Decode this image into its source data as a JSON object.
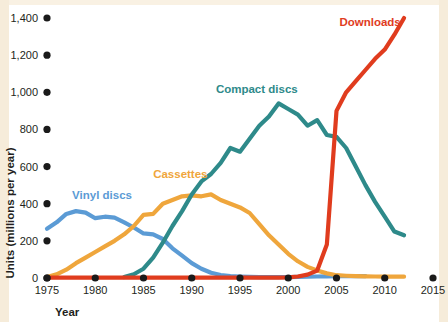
{
  "figure": {
    "background_color": "#ffffff",
    "paper_edge_color": "#f6ecda"
  },
  "chart_data": {
    "type": "line",
    "title": "",
    "xlabel": "Year",
    "ylabel": "Units (millions per year)",
    "xlim": [
      1975,
      2015
    ],
    "ylim": [
      0,
      1400
    ],
    "xticks": [
      1975,
      1980,
      1985,
      1990,
      1995,
      2000,
      2005,
      2010,
      2015
    ],
    "xtick_labels": [
      "1975",
      "1980",
      "1985",
      "1990",
      "1995",
      "2000",
      "2005",
      "2010",
      "2015"
    ],
    "yticks": [
      0,
      200,
      400,
      600,
      800,
      1000,
      1200,
      1400
    ],
    "ytick_labels": [
      "0",
      "200",
      "400",
      "600",
      "800",
      "1,000",
      "1,200",
      "1,400"
    ],
    "grid": false,
    "legend_position": "inline-labels",
    "series": [
      {
        "name": "Vinyl discs",
        "color": "#5B9BD5",
        "label_x": 1977.6,
        "label_y": 425,
        "x": [
          1975,
          1976,
          1977,
          1978,
          1979,
          1980,
          1981,
          1982,
          1983,
          1984,
          1985,
          1986,
          1987,
          1988,
          1989,
          1990,
          1991,
          1992,
          1993,
          1994,
          1995,
          1996,
          1997,
          1998,
          1999,
          2000,
          2001,
          2002,
          2003,
          2004,
          2005,
          2006,
          2007,
          2008
        ],
        "y": [
          265,
          300,
          345,
          360,
          352,
          322,
          330,
          325,
          300,
          272,
          240,
          235,
          210,
          160,
          120,
          80,
          50,
          28,
          16,
          10,
          8,
          6,
          5,
          5,
          5,
          5,
          6,
          7,
          8,
          9,
          10,
          10,
          10,
          10
        ]
      },
      {
        "name": "Cassettes",
        "color": "#EFA63C",
        "label_x": 1986.0,
        "label_y": 540,
        "x": [
          1975,
          1976,
          1977,
          1978,
          1979,
          1980,
          1981,
          1982,
          1983,
          1984,
          1985,
          1986,
          1987,
          1988,
          1989,
          1990,
          1991,
          1992,
          1993,
          1994,
          1995,
          1996,
          1997,
          1998,
          1999,
          2000,
          2001,
          2002,
          2003,
          2004,
          2005,
          2006,
          2007,
          2008,
          2009,
          2010,
          2011,
          2012
        ],
        "y": [
          5,
          20,
          45,
          80,
          110,
          140,
          170,
          200,
          235,
          280,
          340,
          345,
          400,
          420,
          440,
          445,
          440,
          450,
          420,
          400,
          380,
          350,
          290,
          230,
          180,
          130,
          90,
          60,
          40,
          25,
          15,
          12,
          10,
          9,
          8,
          7,
          7,
          7
        ]
      },
      {
        "name": "Compact discs",
        "color": "#2E8A8A",
        "label_x": 1992.5,
        "label_y": 995,
        "x": [
          1983,
          1984,
          1985,
          1986,
          1987,
          1988,
          1989,
          1990,
          1991,
          1992,
          1993,
          1994,
          1995,
          1996,
          1997,
          1998,
          1999,
          2000,
          2001,
          2002,
          2003,
          2004,
          2005,
          2006,
          2007,
          2008,
          2009,
          2010,
          2011,
          2012
        ],
        "y": [
          5,
          20,
          50,
          110,
          190,
          280,
          360,
          450,
          520,
          560,
          620,
          700,
          680,
          750,
          820,
          870,
          940,
          910,
          880,
          820,
          850,
          770,
          760,
          700,
          600,
          500,
          410,
          330,
          250,
          230
        ]
      },
      {
        "name": "Downloads",
        "color": "#E03C1E",
        "label_x": 2005.3,
        "label_y": 1355,
        "x": [
          1975,
          1980,
          1985,
          1990,
          1995,
          1999,
          2000,
          2001,
          2002,
          2003,
          2004,
          2005,
          2006,
          2007,
          2008,
          2009,
          2010,
          2011,
          2012
        ],
        "y": [
          2,
          2,
          2,
          2,
          2,
          2,
          3,
          8,
          18,
          40,
          180,
          900,
          1000,
          1060,
          1120,
          1180,
          1230,
          1310,
          1400
        ]
      }
    ]
  }
}
